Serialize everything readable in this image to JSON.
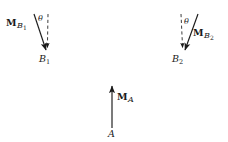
{
  "figure": {
    "background_color": "#ffffff",
    "ink_color": "#1a1a1a",
    "width": 228,
    "height": 142
  },
  "vectors": {
    "b1": {
      "moment_label_m": "M",
      "moment_label_sub": "B",
      "moment_label_subnum": "1",
      "point_label": "B",
      "point_label_subnum": "1",
      "angle_label": "θ",
      "tail": {
        "x": 34,
        "y": 14
      },
      "tip": {
        "x": 47,
        "y": 52
      },
      "dashed_top": {
        "x": 48,
        "y": 14
      },
      "dashed_bottom": {
        "x": 47,
        "y": 50
      }
    },
    "b2": {
      "moment_label_m": "M",
      "moment_label_sub": "B",
      "moment_label_subnum": "2",
      "point_label": "B",
      "point_label_subnum": "2",
      "angle_label": "θ",
      "tail": {
        "x": 198,
        "y": 14
      },
      "tip": {
        "x": 184,
        "y": 52
      },
      "dashed_top": {
        "x": 181,
        "y": 14
      },
      "dashed_bottom": {
        "x": 183,
        "y": 50
      }
    },
    "a": {
      "moment_label_m": "M",
      "moment_label_sub": "A",
      "moment_label_subnum": "",
      "point_label": "A",
      "point_label_subnum": "",
      "tail": {
        "x": 112,
        "y": 128
      },
      "tip": {
        "x": 112,
        "y": 83
      }
    }
  }
}
